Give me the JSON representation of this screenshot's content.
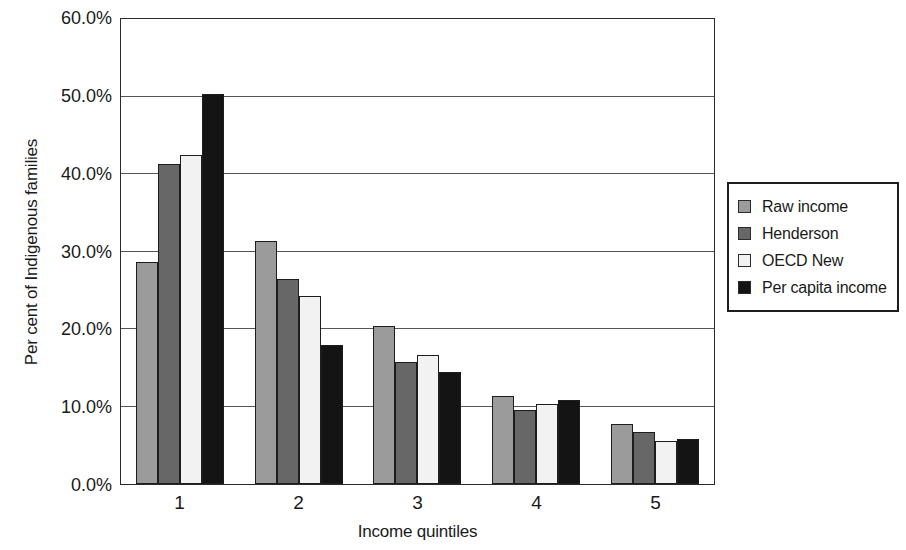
{
  "chart_data": {
    "type": "bar",
    "title": "",
    "xlabel": "Income quintiles",
    "ylabel": "Per cent of Indigenous families",
    "categories": [
      "1",
      "2",
      "3",
      "4",
      "5"
    ],
    "ylim": [
      0,
      60
    ],
    "ytick_labels": [
      "0.0%",
      "10.0%",
      "20.0%",
      "30.0%",
      "40.0%",
      "50.0%",
      "60.0%"
    ],
    "ytick_values": [
      0,
      10,
      20,
      30,
      40,
      50,
      60
    ],
    "grid": true,
    "legend_position": "right",
    "value_suffix": "%",
    "series": [
      {
        "name": "Raw income",
        "color": "#9b9b9b",
        "values": [
          28.7,
          31.3,
          20.4,
          11.4,
          7.8
        ]
      },
      {
        "name": "Henderson",
        "color": "#676767",
        "values": [
          41.3,
          26.4,
          15.8,
          9.5,
          6.7
        ]
      },
      {
        "name": "OECD New",
        "color": "#f2f2f2",
        "values": [
          42.5,
          24.3,
          16.6,
          10.3,
          5.6
        ]
      },
      {
        "name": "Per capita income",
        "color": "#141414",
        "values": [
          50.3,
          17.9,
          14.5,
          10.8,
          5.8
        ]
      }
    ]
  }
}
